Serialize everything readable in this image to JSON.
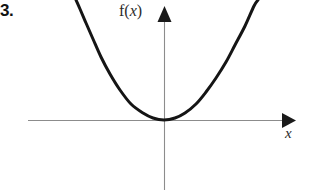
{
  "figure": {
    "problem_number": "3.",
    "background_color": "#ffffff"
  },
  "labels": {
    "y_axis_function": "f(x)",
    "y_axis_function_prefix": "f(",
    "y_axis_function_variable": "x",
    "y_axis_function_suffix": ")",
    "x_axis_variable": "x"
  },
  "colors": {
    "curve": "#151515",
    "axis": "#8c8c8c",
    "arrow_head": "#1a1a1a",
    "text": "#1a1a1a"
  },
  "chart_data": {
    "type": "line",
    "title": "",
    "subtitle": "",
    "xlabel": "x",
    "ylabel": "f(x)",
    "function": "parabola opening upward with vertex at the origin",
    "grid": false,
    "legend": null,
    "axes": {
      "origin_px": [
        164,
        120
      ],
      "x_axis_y_px": 120,
      "y_axis_x_px": 164,
      "x_axis_start_px": 28,
      "x_axis_end_px": 292,
      "y_axis_top_px": 10,
      "y_axis_bottom_px": 190,
      "x_arrow": "right",
      "y_arrow": "up",
      "ticks": [],
      "tick_labels": []
    },
    "vertex": [
      0,
      0
    ],
    "x": [
      -88,
      -80,
      -70,
      -60,
      -50,
      -40,
      -30,
      -20,
      -10,
      0,
      10,
      20,
      30,
      40,
      50,
      60,
      70,
      80,
      90,
      94
    ],
    "y": [
      120,
      100,
      77,
      57,
      40,
      26,
      14,
      6,
      1.5,
      0,
      1.5,
      6,
      14,
      26,
      40,
      57,
      77,
      100,
      126,
      138
    ],
    "points_px": [
      [
        76,
        0
      ],
      [
        80,
        9
      ],
      [
        86,
        23
      ],
      [
        93,
        39
      ],
      [
        101,
        57
      ],
      [
        110,
        74
      ],
      [
        120,
        90
      ],
      [
        131,
        104
      ],
      [
        143,
        113
      ],
      [
        153,
        118
      ],
      [
        164,
        120
      ],
      [
        175,
        118
      ],
      [
        185,
        113
      ],
      [
        196,
        104
      ],
      [
        206,
        92
      ],
      [
        216,
        78
      ],
      [
        226,
        62
      ],
      [
        235,
        45
      ],
      [
        245,
        26
      ],
      [
        254,
        6
      ],
      [
        258,
        0
      ]
    ],
    "xlim": [
      -95,
      100
    ],
    "ylim": [
      0,
      140
    ]
  }
}
